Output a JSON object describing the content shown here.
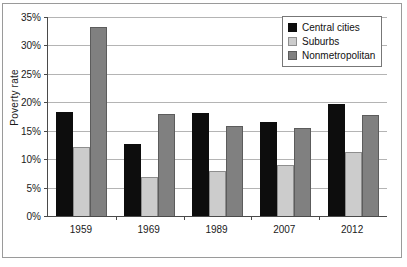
{
  "chart_data": {
    "type": "bar",
    "title": "",
    "xlabel": "",
    "ylabel": "Poverty rate",
    "categories": [
      "1959",
      "1969",
      "1989",
      "2007",
      "2012"
    ],
    "series": [
      {
        "name": "Central cities",
        "color": "#0d0d0d",
        "values": [
          18.3,
          12.7,
          18.1,
          16.5,
          19.7
        ]
      },
      {
        "name": "Suburbs",
        "color": "#cccccc",
        "values": [
          12.2,
          6.8,
          8.0,
          9.0,
          11.2
        ]
      },
      {
        "name": "Nonmetropolitan",
        "color": "#808080",
        "values": [
          33.2,
          17.9,
          15.8,
          15.4,
          17.8
        ]
      }
    ],
    "ylim": [
      0,
      35
    ],
    "ytick_values": [
      0,
      5,
      10,
      15,
      20,
      25,
      30,
      35
    ],
    "ytick_labels": [
      "0%",
      "5%",
      "10%",
      "15%",
      "20%",
      "25%",
      "30%",
      "35%"
    ],
    "grid": true,
    "legend_position": "top-right",
    "value_unit": "percent"
  }
}
